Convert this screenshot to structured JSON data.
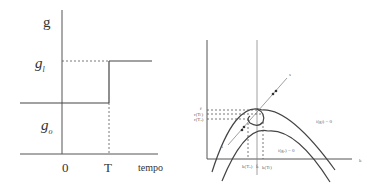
{
  "left_diagram": {
    "y_axis_label": "g",
    "level_high_label": "g",
    "level_high_sub": "l",
    "level_low_label": "g",
    "level_low_sub": "o",
    "tick_zero": "0",
    "tick_T": "T",
    "x_axis_label": "tempo"
  },
  "right_diagram": {
    "y_tick_top": "r̄",
    "y_tick_mid": "r(Tₗ)",
    "y_tick_low": "r(Tₒ)",
    "ray_label": "s",
    "curve_upper_label": "i(gₗ) = 0",
    "curve_lower_label": "i(gₒ) = 0",
    "x_tick_left": "k(Tₒ)",
    "x_tick_mid": "k̄",
    "x_tick_right": "k(Tₗ)",
    "x_axis_label": "k",
    "path_start_label": "s"
  },
  "colors": {
    "line": "#444444",
    "axis": "#555555",
    "background": "#ffffff"
  }
}
